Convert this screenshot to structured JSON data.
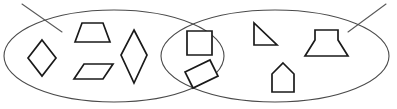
{
  "diagram": {
    "type": "venn-diagram",
    "canvas": {
      "width": 397,
      "height": 109
    },
    "colors": {
      "background": "#ffffff",
      "ellipse_stroke": "#4a4a4a",
      "shape_stroke": "#1a1a1a",
      "shape_fill": "#ffffff",
      "slash_stroke": "#5a5a5a"
    },
    "ellipses": [
      {
        "name": "left-ellipse",
        "cx": 114,
        "cy": 56,
        "rx": 110,
        "ry": 46
      },
      {
        "name": "right-ellipse",
        "cx": 275,
        "cy": 56,
        "rx": 114,
        "ry": 46
      }
    ],
    "slashes": [
      {
        "name": "top-left-slash",
        "x1": 22,
        "y1": 4,
        "x2": 62,
        "y2": 32
      },
      {
        "name": "top-right-slash",
        "x1": 386,
        "y1": 4,
        "x2": 348,
        "y2": 32
      }
    ],
    "regions": {
      "left_only": {
        "name": "left-region",
        "shape_count": 4,
        "shapes": [
          {
            "name": "rhombus-diamond",
            "label": "rhombus",
            "points": "42,40 56,58 42,76 28,58"
          },
          {
            "name": "trapezoid-isosceles",
            "label": "trapezoid",
            "points": "75,42 82,23 103,23 110,42"
          },
          {
            "name": "parallelogram",
            "label": "parallelogram",
            "points": "74,79 84,64 113,64 103,79"
          },
          {
            "name": "kite-diamond-tall",
            "label": "kite",
            "points": "134,30 147,55 134,83 121,55"
          }
        ]
      },
      "intersection": {
        "name": "intersection-region",
        "shape_count": 2,
        "shapes": [
          {
            "name": "square",
            "label": "square",
            "points": "187,31 212,31 212,55 187,55"
          },
          {
            "name": "rectangle-tilted",
            "label": "rectangle",
            "points": "185,72 210,60 218,76 193,88"
          }
        ]
      },
      "right_only": {
        "name": "right-region",
        "shape_count": 3,
        "shapes": [
          {
            "name": "right-triangle",
            "label": "right triangle",
            "points": "254,23 254,45 277,45"
          },
          {
            "name": "podium-trapezoid",
            "label": "podium",
            "points": "315,40 315,30 338,30 338,40 348,56 305,56"
          },
          {
            "name": "pentagon-house",
            "label": "house pentagon",
            "points": "283,63 294,74 294,92 272,92 272,74"
          }
        ]
      }
    }
  }
}
